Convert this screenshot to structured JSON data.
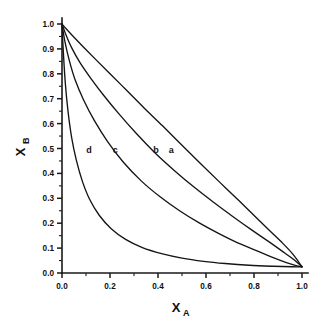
{
  "chart_data": {
    "type": "line",
    "title": "",
    "xlabel": "X_A",
    "ylabel": "X_B",
    "xlabel_base": "X",
    "xlabel_sub": "A",
    "ylabel_base": "X",
    "ylabel_sub": "B",
    "xlim": [
      0.0,
      1.0
    ],
    "ylim": [
      0.0,
      1.0
    ],
    "grid": false,
    "legend_position": "inline-curve-labels",
    "x_ticks_major": [
      "0.0",
      "0.2",
      "0.4",
      "0.6",
      "0.8",
      "1.0"
    ],
    "x_ticks_major_values": [
      0.0,
      0.2,
      0.4,
      0.6,
      0.8,
      1.0
    ],
    "x_ticks_minor_values": [
      0.1,
      0.3,
      0.5,
      0.7,
      0.9
    ],
    "y_ticks_major": [
      "0.0",
      "0.1",
      "0.2",
      "0.3",
      "0.4",
      "0.5",
      "0.6",
      "0.7",
      "0.8",
      "0.9",
      "1.0"
    ],
    "y_ticks_major_values": [
      0.0,
      0.1,
      0.2,
      0.3,
      0.4,
      0.5,
      0.6,
      0.7,
      0.8,
      0.9,
      1.0
    ],
    "y_ticks_minor_values": [
      0.05,
      0.15,
      0.25,
      0.35,
      0.45,
      0.55,
      0.65,
      0.75,
      0.85,
      0.95
    ],
    "series": [
      {
        "name": "a",
        "label": "a",
        "label_x": 0.455,
        "label_y": 0.495,
        "x": [
          0.0,
          0.02,
          0.05,
          0.09,
          0.14,
          0.2,
          0.27,
          0.34,
          0.42,
          0.5,
          0.58,
          0.66,
          0.74,
          0.81,
          0.87,
          0.92,
          0.96,
          0.985,
          1.0
        ],
        "y": [
          1.0,
          0.978,
          0.947,
          0.907,
          0.858,
          0.8,
          0.733,
          0.665,
          0.59,
          0.513,
          0.437,
          0.362,
          0.288,
          0.222,
          0.166,
          0.119,
          0.078,
          0.046,
          0.025
        ]
      },
      {
        "name": "b",
        "label": "b",
        "label_x": 0.392,
        "label_y": 0.495,
        "x": [
          0.0,
          0.015,
          0.04,
          0.075,
          0.12,
          0.175,
          0.24,
          0.31,
          0.39,
          0.47,
          0.55,
          0.63,
          0.71,
          0.79,
          0.86,
          0.92,
          0.96,
          0.985,
          1.0
        ],
        "y": [
          1.0,
          0.96,
          0.905,
          0.845,
          0.782,
          0.712,
          0.636,
          0.56,
          0.48,
          0.41,
          0.345,
          0.285,
          0.228,
          0.173,
          0.127,
          0.086,
          0.058,
          0.038,
          0.025
        ]
      },
      {
        "name": "c",
        "label": "c",
        "label_x": 0.222,
        "label_y": 0.495,
        "x": [
          0.0,
          0.012,
          0.03,
          0.055,
          0.09,
          0.135,
          0.19,
          0.255,
          0.33,
          0.41,
          0.49,
          0.57,
          0.65,
          0.73,
          0.81,
          0.88,
          0.935,
          0.975,
          1.0
        ],
        "y": [
          1.0,
          0.93,
          0.855,
          0.775,
          0.695,
          0.612,
          0.528,
          0.446,
          0.37,
          0.305,
          0.25,
          0.202,
          0.16,
          0.122,
          0.09,
          0.062,
          0.042,
          0.03,
          0.025
        ]
      },
      {
        "name": "d",
        "label": "d",
        "label_x": 0.112,
        "label_y": 0.495,
        "x": [
          0.0,
          0.006,
          0.014,
          0.025,
          0.04,
          0.06,
          0.085,
          0.115,
          0.155,
          0.205,
          0.265,
          0.335,
          0.415,
          0.5,
          0.59,
          0.68,
          0.78,
          0.88,
          0.96,
          1.0
        ],
        "y": [
          1.0,
          0.88,
          0.76,
          0.65,
          0.545,
          0.452,
          0.368,
          0.296,
          0.232,
          0.178,
          0.135,
          0.102,
          0.078,
          0.06,
          0.047,
          0.038,
          0.031,
          0.027,
          0.025,
          0.025
        ]
      }
    ]
  },
  "colors": {
    "curve": "#151515",
    "axis": "#1a1a1a",
    "background": "#ffffff"
  }
}
